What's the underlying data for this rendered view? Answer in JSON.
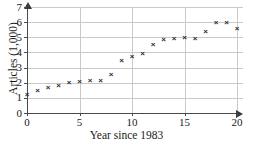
{
  "chart_data": {
    "type": "scatter",
    "title": "",
    "xlabel": "Year since 1983",
    "ylabel": "Articles (1,000)",
    "xlim": [
      0,
      20
    ],
    "ylim": [
      0,
      7
    ],
    "grid": true,
    "legend": null,
    "marker": "x",
    "marker_color": "#2a2a2a",
    "grid_color": "#c9c9c9",
    "axis_color": "#4a4a4a",
    "xticks": [
      0,
      5,
      10,
      15,
      20
    ],
    "xtick_labels": [
      "0",
      "5",
      "10",
      "15",
      "20"
    ],
    "yticks": [
      0,
      1,
      2,
      3,
      4,
      5,
      6,
      7
    ],
    "ytick_labels": [
      "0",
      "1",
      "2",
      "3",
      "4",
      "5",
      "6",
      "7"
    ],
    "x": [
      0,
      1,
      2,
      3,
      4,
      5,
      6,
      7,
      8,
      9,
      10,
      11,
      12,
      13,
      14,
      15,
      16,
      17,
      18,
      19,
      20
    ],
    "y": [
      1.2,
      1.5,
      1.7,
      1.8,
      2.0,
      2.1,
      2.15,
      2.15,
      2.55,
      3.45,
      3.7,
      3.95,
      4.55,
      4.85,
      4.9,
      5.0,
      4.9,
      5.4,
      5.95,
      6.0,
      5.6
    ],
    "points": [
      {
        "x": 0,
        "y": 1.2
      },
      {
        "x": 1,
        "y": 1.5
      },
      {
        "x": 2,
        "y": 1.7
      },
      {
        "x": 3,
        "y": 1.8
      },
      {
        "x": 4,
        "y": 2.0
      },
      {
        "x": 5,
        "y": 2.1
      },
      {
        "x": 6,
        "y": 2.15
      },
      {
        "x": 7,
        "y": 2.15
      },
      {
        "x": 8,
        "y": 2.55
      },
      {
        "x": 9,
        "y": 3.45
      },
      {
        "x": 10,
        "y": 3.7
      },
      {
        "x": 11,
        "y": 3.95
      },
      {
        "x": 12,
        "y": 4.55
      },
      {
        "x": 13,
        "y": 4.85
      },
      {
        "x": 14,
        "y": 4.9
      },
      {
        "x": 15,
        "y": 5.0
      },
      {
        "x": 16,
        "y": 4.9
      },
      {
        "x": 17,
        "y": 5.4
      },
      {
        "x": 18,
        "y": 5.95
      },
      {
        "x": 19,
        "y": 6.0
      },
      {
        "x": 20,
        "y": 5.6
      }
    ]
  }
}
